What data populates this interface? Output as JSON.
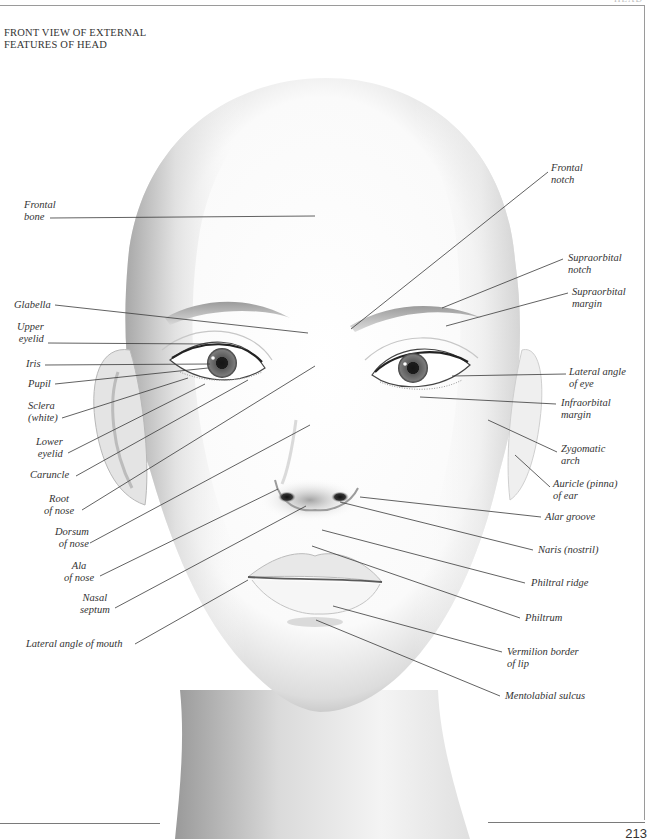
{
  "page": {
    "title_lines": [
      "FRONT VIEW OF EXTERNAL",
      "FEATURES OF HEAD"
    ],
    "running_head": "HEAD",
    "page_number": "213"
  },
  "labels_left": [
    {
      "id": "frontal-bone",
      "lines": [
        "Frontal",
        "bone"
      ]
    },
    {
      "id": "glabella",
      "lines": [
        "Glabella"
      ]
    },
    {
      "id": "upper-eyelid",
      "lines": [
        "Upper",
        "eyelid"
      ]
    },
    {
      "id": "iris",
      "lines": [
        "Iris"
      ]
    },
    {
      "id": "pupil",
      "lines": [
        "Pupil"
      ]
    },
    {
      "id": "sclera",
      "lines": [
        "Sclera",
        "(white)"
      ]
    },
    {
      "id": "lower-eyelid",
      "lines": [
        "Lower",
        "eyelid"
      ]
    },
    {
      "id": "caruncle",
      "lines": [
        "Caruncle"
      ]
    },
    {
      "id": "root-of-nose",
      "lines": [
        "Root",
        "of  nose"
      ]
    },
    {
      "id": "dorsum-of-nose",
      "lines": [
        "Dorsum",
        "of  nose"
      ]
    },
    {
      "id": "ala-of-nose",
      "lines": [
        "Ala",
        "of nose"
      ]
    },
    {
      "id": "nasal-septum",
      "lines": [
        "Nasal",
        "septum"
      ]
    },
    {
      "id": "lateral-angle-of-mouth",
      "lines": [
        "Lateral angle of  mouth"
      ]
    }
  ],
  "labels_right": [
    {
      "id": "frontal-notch",
      "lines": [
        "Frontal",
        "notch"
      ]
    },
    {
      "id": "supraorbital-notch",
      "lines": [
        "Supraorbital",
        "notch"
      ]
    },
    {
      "id": "supraorbital-margin",
      "lines": [
        "Supraorbital",
        "margin"
      ]
    },
    {
      "id": "lateral-angle-of-eye",
      "lines": [
        "Lateral angle",
        "of  eye"
      ]
    },
    {
      "id": "infraorbital-margin",
      "lines": [
        "Infraorbital",
        "margin"
      ]
    },
    {
      "id": "zygomatic-arch",
      "lines": [
        "Zygomatic",
        "arch"
      ]
    },
    {
      "id": "auricle-of-ear",
      "lines": [
        "Auricle (pinna)",
        "of  ear"
      ]
    },
    {
      "id": "alar-groove",
      "lines": [
        "Alar groove"
      ]
    },
    {
      "id": "naris",
      "lines": [
        "Naris (nostril)"
      ]
    },
    {
      "id": "philtral-ridge",
      "lines": [
        "Philtral ridge"
      ]
    },
    {
      "id": "philtrum",
      "lines": [
        "Philtrum"
      ]
    },
    {
      "id": "vermilion-border",
      "lines": [
        "Vermilion border",
        "of  lip"
      ]
    },
    {
      "id": "mentolabial-sulcus",
      "lines": [
        "Mentolabial sulcus"
      ]
    }
  ],
  "colors": {
    "leader_line": "#3a3a3a",
    "skin_shadow": "#b5b5b5",
    "iris": "#6a6a6a",
    "pupil": "#111111"
  }
}
